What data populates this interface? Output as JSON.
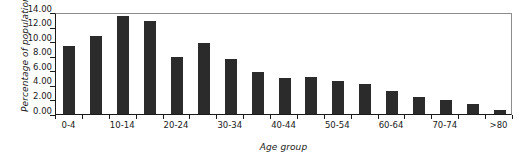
{
  "chart_data": {
    "type": "bar",
    "title": "",
    "xlabel": "Age group",
    "ylabel": "Percentage of population",
    "ylim": [
      0,
      14
    ],
    "ytick_step": 2,
    "ytick_labels": [
      "14.00",
      "12.00",
      "10.00",
      "8.00",
      "6.00",
      "4.00",
      "2.00",
      "0.00"
    ],
    "ytick_values": [
      14,
      12,
      10,
      8,
      6,
      4,
      2,
      0
    ],
    "grid": false,
    "legend": false,
    "bar_color": "#2b2b2b",
    "axis_color": "#1a1a1a",
    "frame_color": "#8d8d8d",
    "categories": [
      "0-4",
      "5-9",
      "10-14",
      "15-19",
      "20-24",
      "25-29",
      "30-34",
      "35-39",
      "40-44",
      "45-49",
      "50-54",
      "55-59",
      "60-64",
      "65-69",
      "70-74",
      "75-79",
      ">80"
    ],
    "visible_tick_labels": [
      "0-4",
      "10-14",
      "20-24",
      "30-34",
      "40-44",
      "50-54",
      "60-64",
      "70-74",
      ">80"
    ],
    "visible_tick_indices": [
      0,
      2,
      4,
      6,
      8,
      10,
      12,
      14,
      16
    ],
    "values": [
      9.4,
      10.7,
      13.4,
      12.7,
      7.8,
      9.7,
      7.5,
      5.7,
      5.0,
      5.1,
      4.6,
      4.1,
      3.2,
      2.4,
      1.9,
      1.4,
      0.6
    ]
  }
}
